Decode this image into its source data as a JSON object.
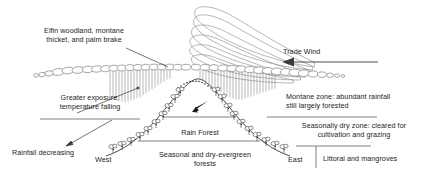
{
  "diagram": {
    "type": "cross-section-schematic",
    "colors": {
      "ink": "#1d1d1b",
      "line": "#3a3a3a",
      "cloud_stroke": "#6e6e6e",
      "rain_stroke": "#7a7a7a",
      "background": "#ffffff"
    },
    "labels": {
      "elfin": "Elfin woodland, montane\nthicket, and palm brake",
      "trade_wind": "Trade Wind",
      "greater_exposure": "Greater exposure,\ntemperature falling",
      "montane_zone": "Montane zone: abundant rainfall\nstill largely forested",
      "rainfall_decreasing": "Rainfall decreasing",
      "rain_forest": "Rain Forest",
      "seasonally_dry": "Seasonally dry zone: cleared for\ncultivation and grazing",
      "west": "West",
      "east": "East",
      "seasonal_dry_evergreen": "Seasonal and dry-evergreen\nforests",
      "littoral": "Littoral and mangroves"
    },
    "icons": {
      "trade_wind_arrow": "left-arrow-icon",
      "downslope_arrow": "down-left-arrow-icon",
      "leader_elfin": "leader-line-icon",
      "leader_exposure": "leader-line-icon",
      "leader_rainfall": "leader-line-arrow-icon",
      "clouds": "cloud-band-icon",
      "plume": "cloud-plume-icon",
      "rain": "rain-hatching-icon",
      "trees": "tree-symbol-icon",
      "mountain": "mountain-profile-icon",
      "bracket_littoral": "bracket-icon"
    }
  }
}
